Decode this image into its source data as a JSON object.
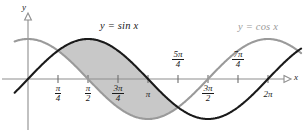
{
  "figure": {
    "background_color": "#ffffff"
  },
  "axes": {
    "x_axis_label": "x",
    "y_axis_label": "y",
    "axis_color": "#8e8e8e",
    "tick_color": "#6e6e6e",
    "x_range": [
      -0.35,
      7.15
    ],
    "y_range": [
      -1.28,
      1.28
    ],
    "grid": false
  },
  "series_labels": {
    "sin": {
      "text": "y = sin x",
      "color": "#1a1a1a",
      "x": 100,
      "y": 26
    },
    "cos": {
      "text": "y = cos x",
      "color": "#9a9a9a",
      "x": 238,
      "y": 27
    }
  },
  "ticks": [
    {
      "id": "pi-over-4",
      "numerator": "π",
      "denominator": "4",
      "kind": "fraction",
      "value": 0.7853981634,
      "position": "below",
      "x": 58,
      "y": 84
    },
    {
      "id": "pi-over-2",
      "numerator": "π",
      "denominator": "2",
      "kind": "fraction",
      "value": 1.5707963268,
      "position": "below",
      "x": 88,
      "y": 84
    },
    {
      "id": "3pi-over-4",
      "numerator": "3π",
      "denominator": "4",
      "kind": "fraction",
      "value": 2.3561944902,
      "position": "below",
      "x": 118,
      "y": 84
    },
    {
      "id": "pi",
      "numerator": "π",
      "denominator": "",
      "kind": "plain",
      "value": 3.1415926536,
      "position": "below",
      "x": 148,
      "y": 84
    },
    {
      "id": "5pi-over-4",
      "numerator": "5π",
      "denominator": "4",
      "kind": "fraction",
      "value": 3.926990817,
      "position": "above",
      "x": 178,
      "y": 51
    },
    {
      "id": "3pi-over-2",
      "numerator": "3π",
      "denominator": "2",
      "kind": "fraction",
      "value": 4.7123889804,
      "position": "below",
      "x": 208,
      "y": 84
    },
    {
      "id": "7pi-over-4",
      "numerator": "7π",
      "denominator": "4",
      "kind": "fraction",
      "value": 5.4977871438,
      "position": "above",
      "x": 238,
      "y": 51
    },
    {
      "id": "2pi",
      "numerator": "2π",
      "denominator": "",
      "kind": "plain",
      "value": 6.2831853072,
      "position": "below",
      "x": 268,
      "y": 84
    }
  ],
  "chart_data": {
    "type": "line",
    "title": "",
    "xlabel": "x",
    "ylabel": "y",
    "xlim": [
      -0.35,
      7.15
    ],
    "ylim": [
      -1.28,
      1.28
    ],
    "grid": false,
    "legend": "inline-annotations",
    "x_tick_labels": [
      "π/4",
      "π/2",
      "3π/4",
      "π",
      "5π/4",
      "3π/2",
      "7π/4",
      "2π"
    ],
    "x_tick_values": [
      0.785398,
      1.570796,
      2.356194,
      3.141593,
      3.926991,
      4.712389,
      5.497787,
      6.283185
    ],
    "series": [
      {
        "name": "y = sin x",
        "color": "#1a1a1a",
        "linewidth": 2.1,
        "x": [
          -0.35,
          0,
          0.3927,
          0.7854,
          1.1781,
          1.5708,
          1.9635,
          2.3562,
          2.7489,
          3.1416,
          3.5343,
          3.927,
          4.3197,
          4.7124,
          5.1051,
          5.4978,
          5.8905,
          6.2832,
          7.15
        ],
        "y": [
          -0.3429,
          0,
          0.3827,
          0.7071,
          0.9239,
          1.0,
          0.9239,
          0.7071,
          0.3827,
          0.0,
          -0.3827,
          -0.7071,
          -0.9239,
          -1.0,
          -0.9239,
          -0.7071,
          -0.3827,
          0.0,
          0.7962
        ]
      },
      {
        "name": "y = cos x",
        "color": "#9a9a9a",
        "linewidth": 2.1,
        "x": [
          -0.35,
          0,
          0.3927,
          0.7854,
          1.1781,
          1.5708,
          1.9635,
          2.3562,
          2.7489,
          3.1416,
          3.5343,
          3.927,
          4.3197,
          4.7124,
          5.1051,
          5.4978,
          5.8905,
          6.2832,
          7.15
        ],
        "y": [
          0.9394,
          1.0,
          0.9239,
          0.7071,
          0.3827,
          0.0,
          -0.3827,
          -0.7071,
          -0.9239,
          -1.0,
          -0.9239,
          -0.7071,
          -0.3827,
          0.0,
          0.3827,
          0.7071,
          0.9239,
          1.0,
          0.6049
        ]
      }
    ],
    "shaded_region": {
      "label": "area between sin x and cos x",
      "from_x": 0.785398,
      "to_x": 3.926991,
      "upper": "y = sin x",
      "lower": "y = cos x",
      "fill_color": "#c8c8c8"
    },
    "annotations": [
      {
        "text": "y = sin x",
        "x": 100,
        "y": 26
      },
      {
        "text": "y = cos x",
        "x": 238,
        "y": 27
      }
    ]
  }
}
